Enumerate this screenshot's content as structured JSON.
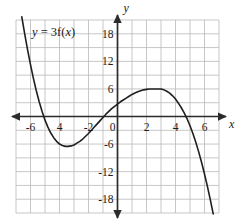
{
  "figure": {
    "background_color": "#ffffff",
    "grid_color": "#b9b9b9",
    "axis_color": "#2b2b2b",
    "curve_color": "#1f1f1f",
    "text_color": "#1a1a1a"
  },
  "labels": {
    "curve_equation_full": "y = 3f(x)",
    "curve_equation_lhs": "y",
    "curve_equation_eq": " = 3f(",
    "curve_equation_var": "x",
    "curve_equation_close": ")",
    "x_axis_name": "x",
    "y_axis_name": "y"
  },
  "chart_data": {
    "type": "line",
    "title": "",
    "subtitle": "",
    "xlabel": "x",
    "ylabel": "y",
    "annotations": [
      "y = 3f(x)"
    ],
    "legend": [],
    "legend_position": "none",
    "grid": true,
    "grid_spacing_x": 1,
    "grid_spacing_y": 3,
    "xlim": [
      -7,
      7
    ],
    "ylim": [
      -21,
      21
    ],
    "xticks": [
      -6,
      -4,
      -2,
      0,
      2,
      4,
      6
    ],
    "xtick_labels": [
      "-6",
      "4",
      "-2",
      "0",
      "2",
      "4",
      "6"
    ],
    "yticks": [
      18,
      12,
      6,
      -6,
      -12,
      -18
    ],
    "ytick_labels": [
      "18",
      "12",
      "6",
      "-6",
      "-12",
      "-18"
    ],
    "series": [
      {
        "name": "y = 3f(x)",
        "description": "cubic curve, zeros near x = -5, 0, 5; local minimum (-3, -6); local maximum (3, 6)",
        "local_minimum": [
          -3,
          -6
        ],
        "local_maximum": [
          3,
          6
        ],
        "roots": [
          -5,
          0,
          5
        ],
        "x": [
          -6.6,
          -6.4,
          -6.2,
          -6.0,
          -5.8,
          -5.6,
          -5.4,
          -5.2,
          -5.0,
          -4.8,
          -4.6,
          -4.4,
          -4.2,
          -4.0,
          -3.8,
          -3.6,
          -3.4,
          -3.2,
          -3.0,
          -2.8,
          -2.6,
          -2.4,
          -2.2,
          -2.0,
          -1.8,
          -1.6,
          -1.4,
          -1.2,
          -1.0,
          -0.8,
          -0.6,
          -0.4,
          -0.2,
          0.0,
          0.2,
          0.4,
          0.6,
          0.8,
          1.0,
          1.2,
          1.4,
          1.6,
          1.8,
          2.0,
          2.2,
          2.4,
          2.6,
          2.8,
          3.0,
          3.2,
          3.4,
          3.6,
          3.8,
          4.0,
          4.2,
          4.4,
          4.6,
          4.8,
          5.0,
          5.2,
          5.4,
          5.6,
          5.8,
          6.0,
          6.2,
          6.4,
          6.6
        ],
        "y": [
          21.7,
          18.0,
          14.5,
          11.3,
          8.3,
          5.6,
          3.2,
          1.1,
          -0.8,
          -2.3,
          -3.6,
          -4.6,
          -5.4,
          -6.0,
          -6.3,
          -6.5,
          -6.5,
          -6.4,
          -6.2,
          -5.8,
          -5.4,
          -4.9,
          -4.3,
          -3.7,
          -3.0,
          -2.3,
          -1.6,
          -0.9,
          -0.2,
          0.5,
          1.1,
          1.7,
          2.2,
          2.7,
          3.2,
          3.6,
          4.0,
          4.4,
          4.8,
          5.1,
          5.4,
          5.6,
          5.8,
          5.9,
          6.0,
          6.0,
          6.0,
          6.0,
          6.0,
          5.8,
          5.5,
          5.1,
          4.5,
          3.8,
          2.9,
          1.9,
          0.8,
          -0.5,
          -2.0,
          -3.7,
          -5.6,
          -7.7,
          -10.0,
          -12.5,
          -15.2,
          -18.1,
          -21.2
        ]
      }
    ]
  }
}
